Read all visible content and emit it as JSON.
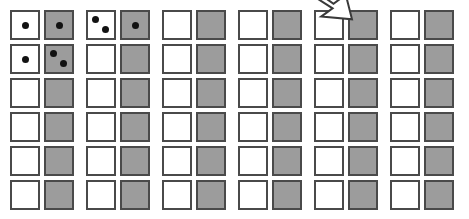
{
  "figure": {
    "colors": {
      "background": "#ffffff",
      "white_face": "#ffffff",
      "gray_face": "#9c9c9c",
      "border": "#4a4a4a",
      "pip": "#121212",
      "arrow_fill": "#ffffff",
      "arrow_stroke": "#3a3a3a"
    },
    "layout": {
      "rows": 6,
      "column_groups": 6,
      "columns_per_group": 2,
      "die_size": 30,
      "col_x": [
        10,
        44,
        86,
        120,
        162,
        196,
        238,
        272,
        314,
        348,
        390,
        424
      ],
      "row_y": [
        10,
        44,
        78,
        112,
        146,
        180
      ]
    }
  },
  "arrow": {
    "name": "down-arrow",
    "label": "",
    "x": 308,
    "y": -14,
    "width": 44,
    "height": 34,
    "direction": "down-right"
  },
  "chart_data": {
    "type": "table",
    "xlabel": "",
    "ylabel": "",
    "categories": [
      "pair-1",
      "pair-2",
      "pair-3",
      "pair-4",
      "pair-5",
      "pair-6"
    ],
    "grid": [
      [
        {
          "face": "white",
          "pips": 1
        },
        {
          "face": "gray",
          "pips": 1
        },
        {
          "face": "white",
          "pips": 2
        },
        {
          "face": "gray",
          "pips": 1
        },
        {
          "face": "white",
          "pips": 0
        },
        {
          "face": "gray",
          "pips": 0
        },
        {
          "face": "white",
          "pips": 0
        },
        {
          "face": "gray",
          "pips": 0
        },
        {
          "face": "white",
          "pips": 0
        },
        {
          "face": "gray",
          "pips": 0
        },
        {
          "face": "white",
          "pips": 0
        },
        {
          "face": "gray",
          "pips": 0
        }
      ],
      [
        {
          "face": "white",
          "pips": 1
        },
        {
          "face": "gray",
          "pips": 2
        },
        {
          "face": "white",
          "pips": 0
        },
        {
          "face": "gray",
          "pips": 0
        },
        {
          "face": "white",
          "pips": 0
        },
        {
          "face": "gray",
          "pips": 0
        },
        {
          "face": "white",
          "pips": 0
        },
        {
          "face": "gray",
          "pips": 0
        },
        {
          "face": "white",
          "pips": 0
        },
        {
          "face": "gray",
          "pips": 0
        },
        {
          "face": "white",
          "pips": 0
        },
        {
          "face": "gray",
          "pips": 0
        }
      ],
      [
        {
          "face": "white",
          "pips": 0
        },
        {
          "face": "gray",
          "pips": 0
        },
        {
          "face": "white",
          "pips": 0
        },
        {
          "face": "gray",
          "pips": 0
        },
        {
          "face": "white",
          "pips": 0
        },
        {
          "face": "gray",
          "pips": 0
        },
        {
          "face": "white",
          "pips": 0
        },
        {
          "face": "gray",
          "pips": 0
        },
        {
          "face": "white",
          "pips": 0
        },
        {
          "face": "gray",
          "pips": 0
        },
        {
          "face": "white",
          "pips": 0
        },
        {
          "face": "gray",
          "pips": 0
        }
      ],
      [
        {
          "face": "white",
          "pips": 0
        },
        {
          "face": "gray",
          "pips": 0
        },
        {
          "face": "white",
          "pips": 0
        },
        {
          "face": "gray",
          "pips": 0
        },
        {
          "face": "white",
          "pips": 0
        },
        {
          "face": "gray",
          "pips": 0
        },
        {
          "face": "white",
          "pips": 0
        },
        {
          "face": "gray",
          "pips": 0
        },
        {
          "face": "white",
          "pips": 0
        },
        {
          "face": "gray",
          "pips": 0
        },
        {
          "face": "white",
          "pips": 0
        },
        {
          "face": "gray",
          "pips": 0
        }
      ],
      [
        {
          "face": "white",
          "pips": 0
        },
        {
          "face": "gray",
          "pips": 0
        },
        {
          "face": "white",
          "pips": 0
        },
        {
          "face": "gray",
          "pips": 0
        },
        {
          "face": "white",
          "pips": 0
        },
        {
          "face": "gray",
          "pips": 0
        },
        {
          "face": "white",
          "pips": 0
        },
        {
          "face": "gray",
          "pips": 0
        },
        {
          "face": "white",
          "pips": 0
        },
        {
          "face": "gray",
          "pips": 0
        },
        {
          "face": "white",
          "pips": 0
        },
        {
          "face": "gray",
          "pips": 0
        }
      ],
      [
        {
          "face": "white",
          "pips": 0
        },
        {
          "face": "gray",
          "pips": 0
        },
        {
          "face": "white",
          "pips": 0
        },
        {
          "face": "gray",
          "pips": 0
        },
        {
          "face": "white",
          "pips": 0
        },
        {
          "face": "gray",
          "pips": 0
        },
        {
          "face": "white",
          "pips": 0
        },
        {
          "face": "gray",
          "pips": 0
        },
        {
          "face": "white",
          "pips": 0
        },
        {
          "face": "gray",
          "pips": 0
        },
        {
          "face": "white",
          "pips": 0
        },
        {
          "face": "gray",
          "pips": 0
        }
      ]
    ],
    "pip_positions": {
      "1": [
        [
          50,
          50
        ]
      ],
      "2": [
        [
          30,
          28
        ],
        [
          66,
          66
        ]
      ]
    }
  }
}
